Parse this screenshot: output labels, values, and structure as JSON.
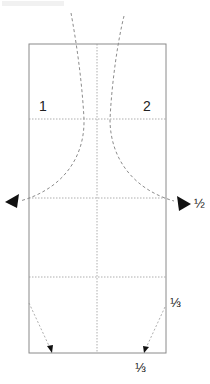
{
  "diagram": {
    "type": "folding-instruction",
    "colors": {
      "outline": "#8a8a8a",
      "guide": "#9a9a9a",
      "curve": "#8c8c8c",
      "arrow": "#111111",
      "text": "#222222"
    },
    "panel": {
      "x": 29,
      "y": 44,
      "width": 137,
      "height": 309
    },
    "guides": {
      "vertical_center_x": 97,
      "horizontal_y": [
        119,
        198,
        277
      ]
    },
    "labels": {
      "step_1": "1",
      "step_2": "2",
      "fraction_half": "½",
      "fraction_third_right": "⅓",
      "fraction_third_bottom": "⅓"
    },
    "arrows": [
      {
        "name": "left-fold-arrow",
        "direction": "left"
      },
      {
        "name": "right-fold-arrow",
        "direction": "right"
      },
      {
        "name": "bottom-left-diagonal-arrow",
        "direction": "down-right"
      },
      {
        "name": "bottom-right-diagonal-arrow",
        "direction": "down-left"
      }
    ]
  }
}
